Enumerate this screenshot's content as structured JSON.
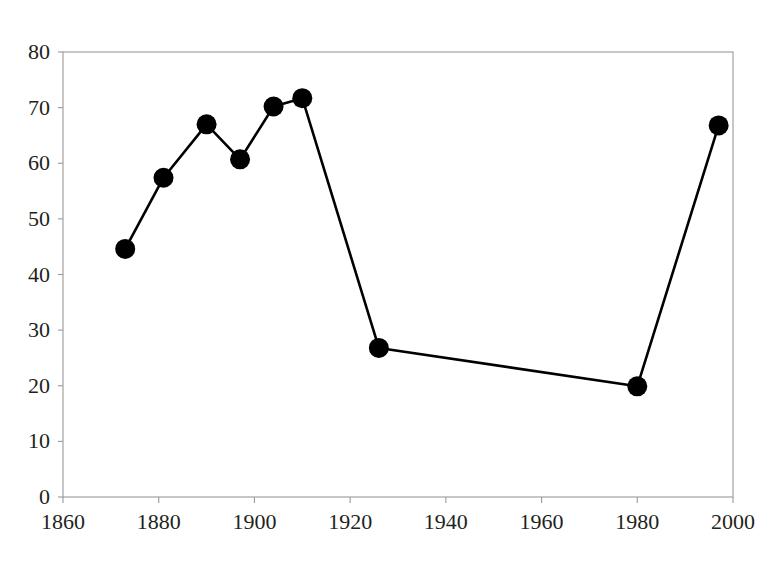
{
  "chart_data": {
    "type": "line",
    "title": "",
    "xlabel": "",
    "ylabel": "",
    "xlim": [
      1860,
      2000
    ],
    "ylim": [
      0,
      80
    ],
    "xticks": [
      1860,
      1880,
      1900,
      1920,
      1940,
      1960,
      1980,
      2000
    ],
    "yticks": [
      0,
      10,
      20,
      30,
      40,
      50,
      60,
      70,
      80
    ],
    "grid": false,
    "legend": "none",
    "marker": "filled-circle",
    "line_color": "#000000",
    "marker_color": "#000000",
    "axis_color": "#9a9a9a",
    "background_color": "#ffffff",
    "x": [
      1873,
      1881,
      1890,
      1897,
      1904,
      1910,
      1926,
      1980,
      1997
    ],
    "values": [
      44.6,
      57.4,
      67.0,
      60.7,
      70.2,
      71.7,
      26.8,
      19.9,
      66.8
    ],
    "points": [
      {
        "x": 1873,
        "y": 44.6
      },
      {
        "x": 1881,
        "y": 57.4
      },
      {
        "x": 1890,
        "y": 67.0
      },
      {
        "x": 1897,
        "y": 60.7
      },
      {
        "x": 1904,
        "y": 70.2
      },
      {
        "x": 1910,
        "y": 71.7
      },
      {
        "x": 1926,
        "y": 26.8
      },
      {
        "x": 1980,
        "y": 19.9
      },
      {
        "x": 1997,
        "y": 66.8
      }
    ]
  },
  "axes": {
    "y_tick_labels": [
      "80",
      "70",
      "60",
      "50",
      "40",
      "30",
      "20",
      "10",
      "0"
    ],
    "x_tick_labels": [
      "1860",
      "1880",
      "1900",
      "1920",
      "1940",
      "1960",
      "1980",
      "2000"
    ]
  }
}
